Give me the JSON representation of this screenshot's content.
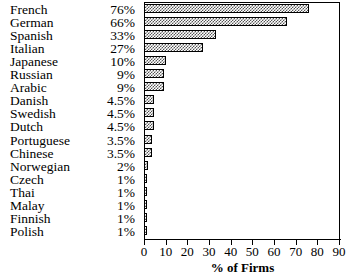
{
  "chart_data": {
    "type": "bar",
    "orientation": "horizontal",
    "title": "",
    "xlabel": "% of Firms",
    "ylabel": "",
    "xlim": [
      0,
      90
    ],
    "xticks": [
      0,
      10,
      20,
      30,
      40,
      50,
      60,
      70,
      80,
      90
    ],
    "grid": false,
    "legend": null,
    "categories": [
      "French",
      "German",
      "Spanish",
      "Italian",
      "Japanese",
      "Russian",
      "Arabic",
      "Danish",
      "Swedish",
      "Dutch",
      "Portuguese",
      "Chinese",
      "Norwegian",
      "Czech",
      "Thai",
      "Malay",
      "Finnish",
      "Polish"
    ],
    "values": [
      76,
      66,
      33,
      27,
      10,
      9,
      9,
      4.5,
      4.5,
      4.5,
      3.5,
      3.5,
      2,
      1,
      1,
      1,
      1,
      1
    ],
    "value_labels": [
      "76%",
      "66%",
      "33%",
      "27%",
      "10%",
      "9%",
      "9%",
      "4.5%",
      "4.5%",
      "4.5%",
      "3.5%",
      "3.5%",
      "2%",
      "1%",
      "1%",
      "1%",
      "1%",
      "1%"
    ],
    "tick_labels": [
      "0",
      "10",
      "20",
      "30",
      "40",
      "50",
      "60",
      "70",
      "80",
      "90"
    ],
    "bar_fill": "#808080",
    "bar_outline": "#000000",
    "bar_pattern": "checkerboard-dither"
  }
}
